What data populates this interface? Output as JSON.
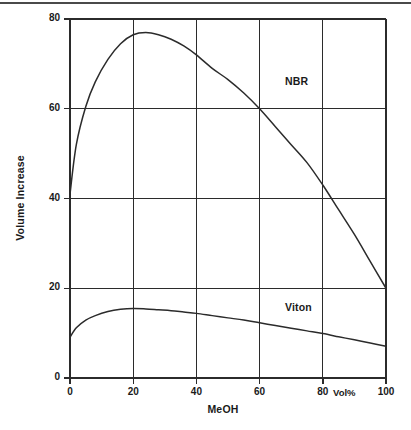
{
  "chart_data": {
    "type": "line",
    "title": "",
    "xlabel": "MeOH",
    "ylabel": "Volume Increase",
    "xunit": "Vol%",
    "xlim": [
      0,
      100
    ],
    "ylim": [
      0,
      80
    ],
    "xticks": [
      "0",
      "20",
      "40",
      "60",
      "80",
      "100"
    ],
    "xtick_values": [
      0,
      20,
      40,
      60,
      80,
      100
    ],
    "yticks": [
      "0",
      "20",
      "40",
      "60",
      "80"
    ],
    "ytick_values": [
      0,
      20,
      40,
      60,
      80
    ],
    "grid": true,
    "grid_x_values": [
      20,
      40,
      60,
      80
    ],
    "grid_y_values": [
      20,
      40,
      60
    ],
    "legend_position": "inline-annotation",
    "series": [
      {
        "name": "NBR",
        "label_x": 68,
        "label_y": 66,
        "x": [
          0,
          2,
          5,
          8,
          12,
          16,
          20,
          24,
          28,
          32,
          36,
          40,
          45,
          50,
          55,
          60,
          65,
          70,
          75,
          80,
          85,
          90,
          95,
          100
        ],
        "values": [
          41,
          52,
          60.5,
          66,
          71,
          74.5,
          76.5,
          77,
          76.5,
          75.5,
          74,
          72,
          69,
          66.5,
          63.5,
          60,
          56,
          52,
          48,
          43,
          37.5,
          32,
          26,
          20
        ]
      },
      {
        "name": "Viton",
        "label_x": 68,
        "label_y": 15.5,
        "x": [
          0,
          2,
          5,
          8,
          12,
          16,
          20,
          24,
          28,
          32,
          36,
          40,
          45,
          50,
          55,
          60,
          65,
          70,
          75,
          80,
          85,
          90,
          95,
          100
        ],
        "values": [
          9.1,
          11.2,
          12.9,
          13.9,
          14.8,
          15.3,
          15.5,
          15.4,
          15.2,
          15,
          14.7,
          14.4,
          13.9,
          13.4,
          12.9,
          12.3,
          11.7,
          11.1,
          10.5,
          9.9,
          9.2,
          8.5,
          7.8,
          7.1
        ]
      }
    ]
  },
  "colors": {
    "axis": "#2b2b2b",
    "grid": "#2b2b2b",
    "curve": "#2b2b2b",
    "text": "#1a1a1a",
    "top_rule": "#4a4a4a",
    "background": "#ffffff"
  }
}
